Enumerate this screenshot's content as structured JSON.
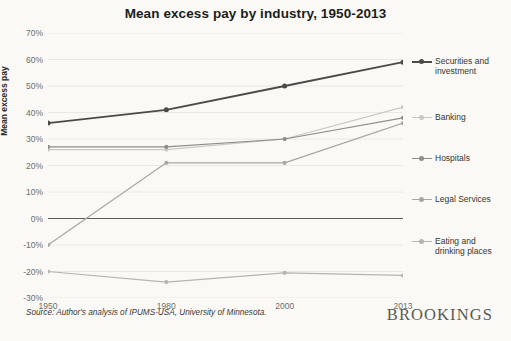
{
  "chart_data": {
    "type": "line",
    "title": "Mean excess pay by industry, 1950-2013",
    "xlabel": "",
    "ylabel": "Mean excess pay",
    "categories": [
      "1950",
      "1980",
      "2000",
      "2013"
    ],
    "ylim": [
      -30,
      70
    ],
    "yticks": [
      "70%",
      "60%",
      "50%",
      "40%",
      "30%",
      "20%",
      "10%",
      "0%",
      "-10%",
      "-20%",
      "-30%"
    ],
    "ytick_values": [
      70,
      60,
      50,
      40,
      30,
      20,
      10,
      0,
      -10,
      -20,
      -30
    ],
    "grid": true,
    "legend_position": "right",
    "series": [
      {
        "name": "Securities and investment",
        "color": "#4a4a48",
        "values": [
          36,
          41,
          50,
          59
        ]
      },
      {
        "name": "Banking",
        "color": "#c9c9c4",
        "values": [
          26,
          26,
          30,
          42
        ]
      },
      {
        "name": "Hospitals",
        "color": "#8e8e89",
        "values": [
          27,
          27,
          30,
          38
        ]
      },
      {
        "name": "Legal Services",
        "color": "#a8a8a2",
        "values": [
          -10,
          21,
          21,
          36
        ]
      },
      {
        "name": "Eating and drinking places",
        "color": "#b5b5af",
        "values": [
          -20,
          -24,
          -20.5,
          -21.5
        ]
      }
    ]
  },
  "footer": {
    "source": "Source: Author's analysis of IPUMS-USA, University of Minnesota.",
    "logo": "BROOKINGS"
  },
  "colors": {
    "background": "#faf9f6",
    "grid": "#e6e5e0",
    "axis_text": "#6d6d69",
    "title_text": "#1d1d1b"
  }
}
